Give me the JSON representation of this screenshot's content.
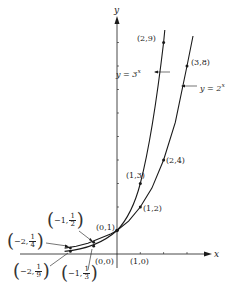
{
  "figure": {
    "axes": {
      "x_label": "x",
      "y_label": "y",
      "origin_label": "(0,0)",
      "x_unit_label": "(1,0)"
    },
    "curves": [
      {
        "name": "y = 3^x",
        "label_text": "y = 3",
        "label_exp": "x"
      },
      {
        "name": "y = 2^x",
        "label_text": "y = 2",
        "label_exp": "x"
      }
    ],
    "points": {
      "p_0_1": "(0,1)",
      "p_1_2": "(1,2)",
      "p_1_3": "(1,3)",
      "p_2_4": "(2,4)",
      "p_2_9": "(2,9)",
      "p_3_8": "(3,8)",
      "p_m1_half": {
        "prefix": "−1,",
        "num": "1",
        "den": "2"
      },
      "p_m1_third": {
        "prefix": "−1,",
        "num": "1",
        "den": "3"
      },
      "p_m2_quarter": {
        "prefix": "−2,",
        "num": "1",
        "den": "4"
      },
      "p_m2_ninth": {
        "prefix": "−2,",
        "num": "1",
        "den": "9"
      }
    },
    "colors": {
      "ink": "#1a1a1a",
      "background": "#ffffff"
    }
  }
}
